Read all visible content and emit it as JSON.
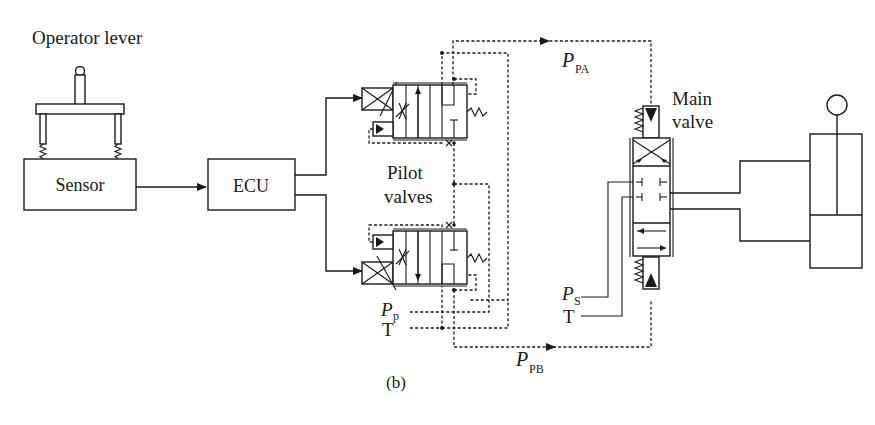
{
  "diagram": {
    "caption": "(b)",
    "labels": {
      "operator_lever": "Operator lever",
      "sensor": "Sensor",
      "ecu": "ECU",
      "pilot_valves_line1": "Pilot",
      "pilot_valves_line2": "valves",
      "main_valve_line1": "Main",
      "main_valve_line2": "valve",
      "ppa_main": "P",
      "ppa_sub": "PA",
      "ppb_main": "P",
      "ppb_sub": "PB",
      "pp_main": "P",
      "pp_sub": "p",
      "pilot_tank": "T",
      "ps_main": "P",
      "ps_sub": "S",
      "main_tank": "T"
    },
    "components": [
      {
        "id": "operator-lever",
        "type": "joystick"
      },
      {
        "id": "sensor",
        "type": "block",
        "label": "Sensor"
      },
      {
        "id": "ecu",
        "type": "block",
        "label": "ECU"
      },
      {
        "id": "pilot-valve-a",
        "type": "proportional-pressure-reducing-valve"
      },
      {
        "id": "pilot-valve-b",
        "type": "proportional-pressure-reducing-valve"
      },
      {
        "id": "main-valve",
        "type": "4/3 directional spool valve"
      },
      {
        "id": "cylinder",
        "type": "hydraulic-cylinder"
      }
    ],
    "connections": [
      {
        "from": "sensor",
        "to": "ecu",
        "style": "solid-arrow"
      },
      {
        "from": "ecu",
        "to": "pilot-valve-a",
        "style": "solid-arrow"
      },
      {
        "from": "ecu",
        "to": "pilot-valve-b",
        "style": "solid-arrow"
      },
      {
        "from": "pilot-valve-a",
        "to": "main-valve",
        "style": "dashed-arrow",
        "label": "P_PA"
      },
      {
        "from": "pilot-valve-b",
        "to": "main-valve",
        "style": "dashed-arrow",
        "label": "P_PB"
      },
      {
        "from": "main-valve",
        "to": "cylinder",
        "style": "solid"
      }
    ]
  }
}
